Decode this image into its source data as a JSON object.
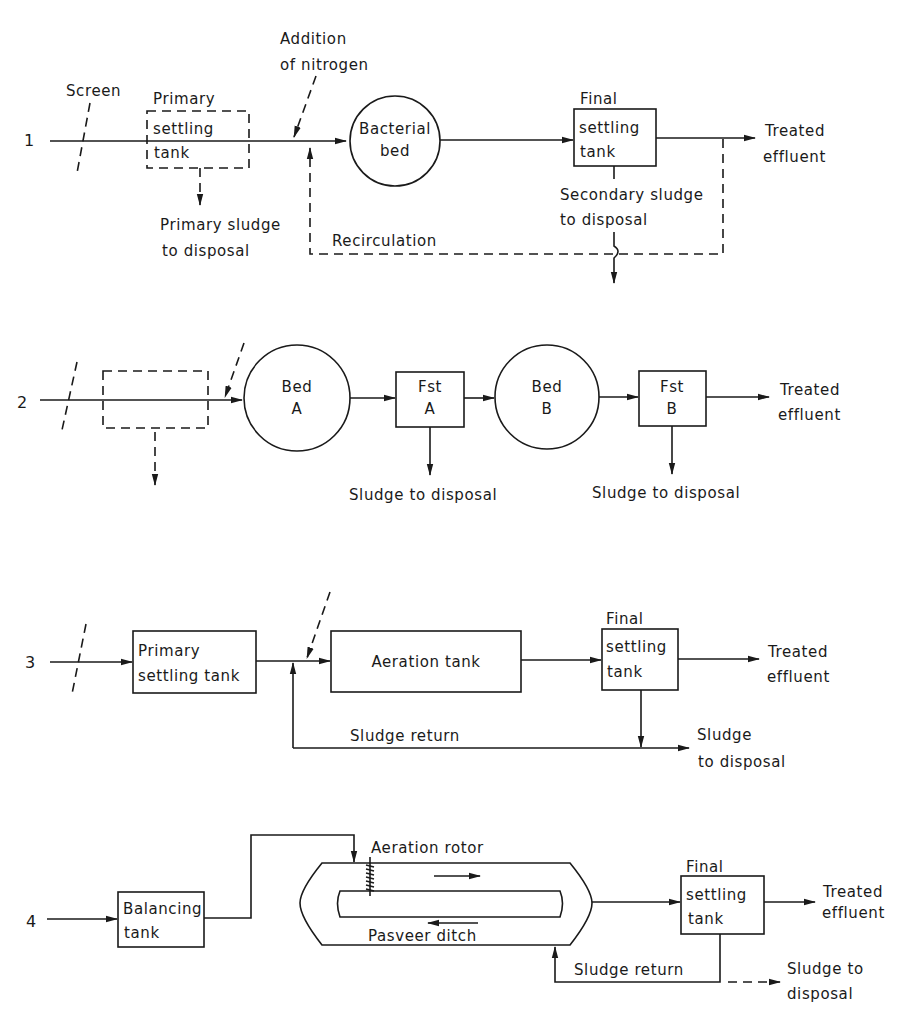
{
  "figure": {
    "type": "wastewater treatment process flow diagrams",
    "line_color": "#1a1a1a",
    "background": "#ffffff"
  },
  "diagram1": {
    "number": "1",
    "screen_label": "Screen",
    "primary_tank": {
      "line1": "Primary",
      "line2": "settling",
      "line3": "tank",
      "style": "dashed"
    },
    "nitrogen_label": {
      "line1": "Addition",
      "line2": "of nitrogen"
    },
    "bacterial_bed": {
      "line1": "Bacterial",
      "line2": "bed"
    },
    "final_tank": {
      "line1": "Final",
      "line2": "settling",
      "line3": "tank"
    },
    "effluent": {
      "line1": "Treated",
      "line2": "effluent"
    },
    "primary_sludge": {
      "line1": "Primary sludge",
      "line2": "to disposal"
    },
    "secondary_sludge": {
      "line1": "Secondary sludge",
      "line2": "to disposal"
    },
    "recirculation_label": "Recirculation"
  },
  "diagram2": {
    "number": "2",
    "bed_a": {
      "line1": "Bed",
      "line2": "A"
    },
    "fst_a": {
      "line1": "Fst",
      "line2": "A"
    },
    "bed_b": {
      "line1": "Bed",
      "line2": "B"
    },
    "fst_b": {
      "line1": "Fst",
      "line2": "B"
    },
    "effluent": {
      "line1": "Treated",
      "line2": "effluent"
    },
    "sludge_a": "Sludge to disposal",
    "sludge_b": "Sludge to disposal"
  },
  "diagram3": {
    "number": "3",
    "primary_tank": {
      "line1": "Primary",
      "line2": "settling tank"
    },
    "aeration_tank": "Aeration tank",
    "final_tank": {
      "line1": "Final",
      "line2": "settling",
      "line3": "tank"
    },
    "effluent": {
      "line1": "Treated",
      "line2": "effluent"
    },
    "sludge_return": "Sludge return",
    "sludge_disposal": {
      "line1": "Sludge",
      "line2": "to disposal"
    }
  },
  "diagram4": {
    "number": "4",
    "balancing_tank": {
      "line1": "Balancing",
      "line2": "tank"
    },
    "rotor_label": "Aeration rotor",
    "ditch_label": "Pasveer ditch",
    "final_tank": {
      "line1": "Final",
      "line2": "settling",
      "line3": "tank"
    },
    "effluent": {
      "line1": "Treated",
      "line2": "effluent"
    },
    "sludge_return": "Sludge return",
    "sludge_disposal": {
      "line1": "Sludge to",
      "line2": "disposal"
    }
  }
}
